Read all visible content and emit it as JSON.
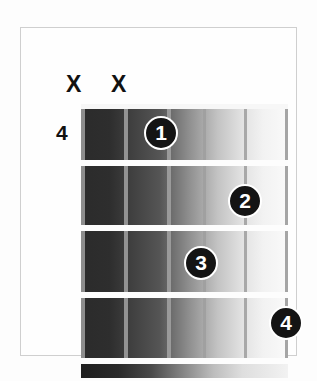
{
  "diagram": {
    "kind": "guitar-chord-diagram",
    "start_fret_label": "4",
    "string_count": 6,
    "fret_count": 4,
    "muted_strings": [
      {
        "name": "mute-string-6",
        "marker": "X"
      },
      {
        "name": "mute-string-5",
        "marker": "X"
      }
    ],
    "finger_positions": [
      {
        "finger": "1",
        "string": 4,
        "fret": 1
      },
      {
        "finger": "2",
        "string": 2,
        "fret": 2
      },
      {
        "finger": "3",
        "string": 3,
        "fret": 3
      },
      {
        "finger": "4",
        "string": 1,
        "fret": 4
      }
    ],
    "colors": {
      "dot_fill": "#141414",
      "dot_ring": "#ffffff",
      "dot_text": "#ffffff",
      "marker_text": "#111111",
      "label_text": "#111111",
      "frame_border": "#cfcfcf",
      "fret_line": "#fdfdfd",
      "string_line": "#9a9a9a",
      "board_dark": "#2b2b2b",
      "board_light": "#fafafa",
      "page_background": "#ffffff"
    }
  }
}
